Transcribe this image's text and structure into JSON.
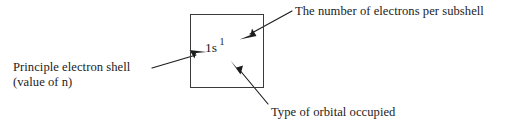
{
  "diagram": {
    "stroke_color": "#3a3a3a",
    "text_color": "#1c1c1c",
    "background_color": "#ffffff",
    "box": {
      "label": "orbital-notation-box",
      "x": 190,
      "y": 14,
      "width": 74,
      "height": 74
    },
    "notation": {
      "principal_quantum_number": "1",
      "subshell_letter": "s",
      "base": "1s",
      "electron_count_superscript": "1",
      "full": "1s1"
    },
    "callouts": [
      {
        "id": "electron-count",
        "text": "The number of electrons per subshell",
        "arrow_from": [
          292,
          11
        ],
        "arrow_to": [
          240,
          39
        ],
        "position": "top-right"
      },
      {
        "id": "principal-shell",
        "line1": "Principle electron shell",
        "line2": "(value of n)",
        "arrow_from": [
          152,
          68
        ],
        "arrow_to": [
          206,
          52
        ],
        "position": "left"
      },
      {
        "id": "orbital-type",
        "text": "Type of orbital occupied",
        "arrow_from": [
          268,
          104
        ],
        "arrow_to": [
          231,
          61
        ],
        "position": "bottom-right"
      }
    ]
  }
}
